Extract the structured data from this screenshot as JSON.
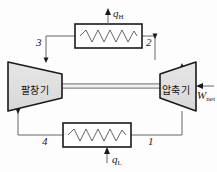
{
  "diagram": {
    "type": "thermodynamic-cycle-schematic",
    "background_color": "#fdfdfd",
    "line_color": "#555555",
    "outline_color": "#1a1a1a",
    "device_fill": "#e0e0e0",
    "devices": [
      {
        "id": "expander",
        "label": "팔창기",
        "shape": "trapezoid-wide-left",
        "role": "turbine"
      },
      {
        "id": "compressor",
        "label": "압축기",
        "shape": "trapezoid-wide-right",
        "role": "compressor"
      }
    ],
    "heat_exchangers": [
      {
        "id": "upper-heat-exchanger",
        "position": "top",
        "coil": "zigzag"
      },
      {
        "id": "lower-heat-exchanger",
        "position": "bottom",
        "coil": "zigzag"
      }
    ],
    "state_points": [
      {
        "id": "state-1",
        "label": "1",
        "location": "bottom-right"
      },
      {
        "id": "state-2",
        "label": "2",
        "location": "top-right"
      },
      {
        "id": "state-3",
        "label": "3",
        "location": "top-left"
      },
      {
        "id": "state-4",
        "label": "4",
        "location": "bottom-left"
      }
    ],
    "flows": [
      {
        "id": "heat-rejected",
        "symbol": "q",
        "subscript": "H",
        "direction": "out-up",
        "at": "upper-heat-exchanger"
      },
      {
        "id": "heat-absorbed",
        "symbol": "q",
        "subscript": "L",
        "direction": "in-up",
        "at": "lower-heat-exchanger"
      },
      {
        "id": "net-work",
        "symbol": "W",
        "subscript": "net",
        "direction": "in-left",
        "at": "compressor"
      }
    ],
    "shaft": {
      "id": "connecting-shaft",
      "style": "double-line"
    }
  }
}
